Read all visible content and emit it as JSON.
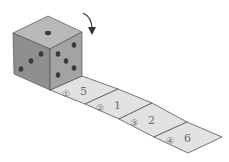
{
  "diagram": {
    "die": {
      "top_face_pips": 1,
      "left_face_pips": 3,
      "right_face_pips": 5
    },
    "rotation_arrow": "curved-arrow-down",
    "cells": [
      {
        "index": "①",
        "value": "5"
      },
      {
        "index": "②",
        "value": "1"
      },
      {
        "index": "③",
        "value": "2"
      },
      {
        "index": "④",
        "value": "6"
      }
    ],
    "colors": {
      "cube_top": "#b9b9b9",
      "cube_left": "#8f8f8f",
      "cube_right": "#a3a3a3",
      "pip": "#3a3a3a",
      "strip": "#e2e2e2",
      "line": "#555555"
    }
  }
}
